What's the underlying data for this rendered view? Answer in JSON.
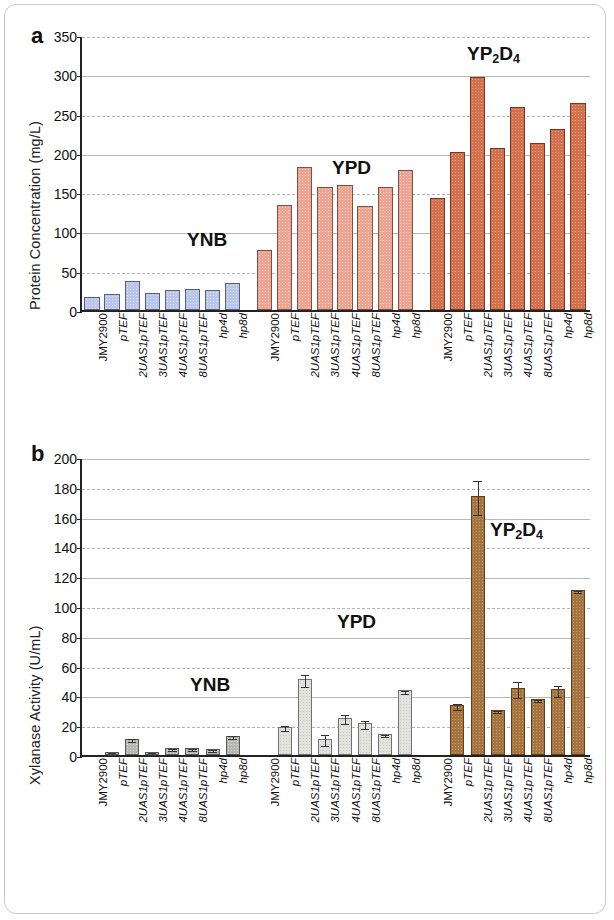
{
  "figure": {
    "panels": [
      {
        "letter": "a",
        "ylabel": "Protein Concentration (mg/L)",
        "group_labels": [
          "YNB",
          "YPD",
          "YP2D4"
        ]
      },
      {
        "letter": "b",
        "ylabel": "Xylanase Activity (U/mL)",
        "group_labels": [
          "YNB",
          "YPD",
          "YP2D4"
        ]
      }
    ],
    "strains": [
      "JMY2900",
      "pTEF",
      "2UAS1pTEF",
      "3UAS1pTEF",
      "4UAS1pTEF",
      "8UAS1pTEF",
      "hp4d",
      "hp8d"
    ],
    "media": [
      "YNB",
      "YPD",
      "YP2D4"
    ],
    "media_display": [
      "YNB",
      "YPD",
      "YP₂D₄"
    ],
    "colors": {
      "ynb_a": "#b9c6ea",
      "ypd_a": "#eda593",
      "yp2d4_a": "#d4714d",
      "ynb_b": "#b6b6b4",
      "ypd_b": "#e2e2df",
      "yp2d4_b": "#a5743f",
      "axis": "#222222",
      "grid": "#b9b9b9"
    }
  },
  "chart_data": [
    {
      "type": "bar",
      "panel": "a",
      "title": "",
      "xlabel": "",
      "ylabel": "Protein Concentration (mg/L)",
      "ylim": [
        0,
        350
      ],
      "yticks": [
        0,
        50,
        100,
        150,
        200,
        250,
        300,
        350
      ],
      "ytick_labels": [
        "0",
        "50",
        "100",
        "150",
        "200",
        "250",
        "300",
        "350"
      ],
      "grid": true,
      "legend": "none",
      "annotations": [
        "YNB",
        "YPD",
        "YP₂D₄"
      ],
      "categories": [
        "JMY2900",
        "pTEF",
        "2UAS1pTEF",
        "3UAS1pTEF",
        "4UAS1pTEF",
        "8UAS1pTEF",
        "hp4d",
        "hp8d",
        "JMY2900",
        "pTEF",
        "2UAS1pTEF",
        "3UAS1pTEF",
        "4UAS1pTEF",
        "8UAS1pTEF",
        "hp4d",
        "hp8d",
        "JMY2900",
        "pTEF",
        "2UAS1pTEF",
        "3UAS1pTEF",
        "4UAS1pTEF",
        "8UAS1pTEF",
        "hp4d",
        "hp8d"
      ],
      "series": [
        {
          "name": "YNB",
          "categories": [
            "JMY2900",
            "pTEF",
            "2UAS1pTEF",
            "3UAS1pTEF",
            "4UAS1pTEF",
            "8UAS1pTEF",
            "hp4d",
            "hp8d"
          ],
          "values": [
            16,
            21,
            37,
            22,
            26,
            27,
            26,
            35
          ],
          "errors": [
            0,
            0,
            0,
            0,
            0,
            0,
            0,
            0
          ]
        },
        {
          "name": "YPD",
          "categories": [
            "JMY2900",
            "pTEF",
            "2UAS1pTEF",
            "3UAS1pTEF",
            "4UAS1pTEF",
            "8UAS1pTEF",
            "hp4d",
            "hp8d"
          ],
          "values": [
            76,
            134,
            182,
            157,
            159,
            133,
            156,
            178
          ],
          "errors": [
            0,
            0,
            0,
            0,
            0,
            0,
            0,
            0
          ]
        },
        {
          "name": "YP2D4",
          "categories": [
            "JMY2900",
            "pTEF",
            "2UAS1pTEF",
            "3UAS1pTEF",
            "4UAS1pTEF",
            "8UAS1pTEF",
            "hp4d",
            "hp8d"
          ],
          "values": [
            143,
            201,
            296,
            206,
            259,
            213,
            231,
            264
          ],
          "errors": [
            0,
            0,
            0,
            0,
            0,
            0,
            0,
            0
          ]
        }
      ]
    },
    {
      "type": "bar",
      "panel": "b",
      "title": "",
      "xlabel": "",
      "ylabel": "Xylanase Activity (U/mL)",
      "ylim": [
        0,
        200
      ],
      "yticks": [
        0,
        20,
        40,
        60,
        80,
        100,
        120,
        140,
        160,
        180,
        200
      ],
      "ytick_labels": [
        "0",
        "20",
        "40",
        "60",
        "80",
        "100",
        "120",
        "140",
        "160",
        "180",
        "200"
      ],
      "grid": true,
      "legend": "none",
      "annotations": [
        "YNB",
        "YPD",
        "YP₂D₄"
      ],
      "categories": [
        "JMY2900",
        "pTEF",
        "2UAS1pTEF",
        "3UAS1pTEF",
        "4UAS1pTEF",
        "8UAS1pTEF",
        "hp4d",
        "hp8d",
        "JMY2900",
        "pTEF",
        "2UAS1pTEF",
        "3UAS1pTEF",
        "4UAS1pTEF",
        "8UAS1pTEF",
        "hp4d",
        "hp8d",
        "JMY2900",
        "pTEF",
        "2UAS1pTEF",
        "3UAS1pTEF",
        "4UAS1pTEF",
        "8UAS1pTEF",
        "hp4d",
        "hp8d"
      ],
      "series": [
        {
          "name": "YNB",
          "categories": [
            "JMY2900",
            "pTEF",
            "2UAS1pTEF",
            "3UAS1pTEF",
            "4UAS1pTEF",
            "8UAS1pTEF",
            "hp4d",
            "hp8d"
          ],
          "values": [
            0,
            2,
            11,
            2,
            5,
            5,
            4,
            13
          ],
          "errors": [
            0,
            0.5,
            1,
            0.5,
            0.7,
            0.7,
            0.6,
            1.2
          ]
        },
        {
          "name": "YPD",
          "categories": [
            "JMY2900",
            "pTEF",
            "2UAS1pTEF",
            "3UAS1pTEF",
            "4UAS1pTEF",
            "8UAS1pTEF",
            "hp4d",
            "hp8d"
          ],
          "values": [
            0,
            19,
            51,
            11,
            25,
            21.5,
            14,
            43.5
          ],
          "errors": [
            0,
            1.5,
            4,
            3.5,
            3,
            2.5,
            0.8,
            1
          ]
        },
        {
          "name": "YP2D4",
          "categories": [
            "JMY2900",
            "pTEF",
            "2UAS1pTEF",
            "3UAS1pTEF",
            "4UAS1pTEF",
            "8UAS1pTEF",
            "hp4d",
            "hp8d"
          ],
          "values": [
            0,
            33.5,
            174,
            30,
            45,
            37.5,
            44,
            110.5
          ],
          "errors": [
            0,
            2,
            11.5,
            0.8,
            5.5,
            0.7,
            3.5,
            0.6
          ]
        }
      ]
    }
  ]
}
